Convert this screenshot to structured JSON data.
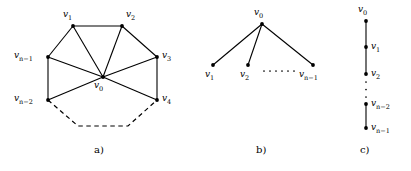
{
  "figure": {
    "width": 411,
    "height": 171,
    "background": "#ffffff",
    "ink": "#000000"
  },
  "panels": [
    {
      "id": "panel-a",
      "caption": "a)",
      "caption_pos": {
        "x": 94,
        "y": 145
      },
      "description": "wheel graph with hub v0 and dashed partial rim",
      "vertices": [
        {
          "id": "v0",
          "base": "v",
          "sub": "0",
          "cx": 103,
          "cy": 77,
          "label_x": 94,
          "label_y": 81
        },
        {
          "id": "v1",
          "base": "v",
          "sub": "1",
          "cx": 73,
          "cy": 26,
          "label_x": 63,
          "label_y": 10
        },
        {
          "id": "v2",
          "base": "v",
          "sub": "2",
          "cx": 122,
          "cy": 26,
          "label_x": 126,
          "label_y": 10
        },
        {
          "id": "v3",
          "base": "v",
          "sub": "3",
          "cx": 157,
          "cy": 57,
          "label_x": 162,
          "label_y": 51
        },
        {
          "id": "v4",
          "base": "v",
          "sub": "4",
          "cx": 157,
          "cy": 100,
          "label_x": 162,
          "label_y": 94
        },
        {
          "id": "vn2",
          "base": "v",
          "sub": "n−2",
          "cx": 48,
          "cy": 100,
          "label_x": 14,
          "label_y": 94
        },
        {
          "id": "vn1",
          "base": "v",
          "sub": "n−1",
          "cx": 48,
          "cy": 57,
          "label_x": 14,
          "label_y": 51
        }
      ],
      "edges": [
        [
          "v0",
          "v1"
        ],
        [
          "v0",
          "v2"
        ],
        [
          "v0",
          "v3"
        ],
        [
          "v0",
          "v4"
        ],
        [
          "v0",
          "vn2"
        ],
        [
          "v0",
          "vn1"
        ],
        [
          "v1",
          "v2"
        ],
        [
          "v2",
          "v3"
        ],
        [
          "v3",
          "v4"
        ],
        [
          "vn1",
          "v1"
        ],
        [
          "vn2",
          "vn1"
        ]
      ],
      "dashed_path": [
        {
          "x": 48,
          "y": 100
        },
        {
          "x": 78,
          "y": 126
        },
        {
          "x": 128,
          "y": 126
        },
        {
          "x": 157,
          "y": 100
        }
      ]
    },
    {
      "id": "panel-b",
      "caption": "b)",
      "caption_pos": {
        "x": 256,
        "y": 145
      },
      "description": "star graph with centre v0 and leaves",
      "vertices": [
        {
          "id": "v0",
          "base": "v",
          "sub": "0",
          "cx": 262,
          "cy": 24,
          "label_x": 254,
          "label_y": 8
        },
        {
          "id": "v1",
          "base": "v",
          "sub": "1",
          "cx": 213,
          "cy": 65,
          "label_x": 205,
          "label_y": 70
        },
        {
          "id": "v2",
          "base": "v",
          "sub": "2",
          "cx": 248,
          "cy": 65,
          "label_x": 240,
          "label_y": 70
        },
        {
          "id": "vn1",
          "base": "v",
          "sub": "n−1",
          "cx": 313,
          "cy": 65,
          "label_x": 299,
          "label_y": 70
        }
      ],
      "edges": [
        [
          "v0",
          "v1"
        ],
        [
          "v0",
          "v2"
        ],
        [
          "v0",
          "vn1"
        ]
      ],
      "ellipsis": {
        "x1": 264,
        "x2": 294,
        "y": 71,
        "dots": 6
      }
    },
    {
      "id": "panel-c",
      "caption": "c)",
      "caption_pos": {
        "x": 360,
        "y": 145
      },
      "description": "path graph drawn vertically",
      "vertices": [
        {
          "id": "v0",
          "base": "v",
          "sub": "0",
          "cx": 366,
          "cy": 21,
          "label_x": 358,
          "label_y": 5
        },
        {
          "id": "v1",
          "base": "v",
          "sub": "1",
          "cx": 366,
          "cy": 47,
          "label_x": 371,
          "label_y": 42
        },
        {
          "id": "v2",
          "base": "v",
          "sub": "2",
          "cx": 366,
          "cy": 74,
          "label_x": 371,
          "label_y": 69
        },
        {
          "id": "vn2",
          "base": "v",
          "sub": "n−2",
          "cx": 366,
          "cy": 104,
          "label_x": 371,
          "label_y": 99
        },
        {
          "id": "vn1",
          "base": "v",
          "sub": "n−1",
          "cx": 366,
          "cy": 128,
          "label_x": 371,
          "label_y": 123
        }
      ],
      "edges": [
        [
          "v0",
          "v1"
        ],
        [
          "v1",
          "v2"
        ],
        [
          "vn2",
          "vn1"
        ]
      ],
      "ellipsis_vertical": {
        "x": 366,
        "y1": 82,
        "y2": 97,
        "dots": 3
      }
    }
  ]
}
